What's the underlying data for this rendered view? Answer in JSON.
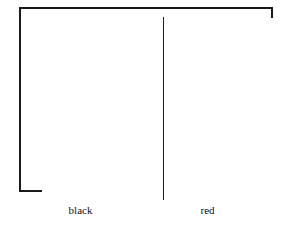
{
  "figure": {
    "background_color": "#ffffff",
    "line_color": "#1a1a1a",
    "panels": [
      {
        "id": "left",
        "caption": "black",
        "fill_color": "#ffffff"
      },
      {
        "id": "right",
        "caption": "red",
        "fill_color": "#ffffff"
      }
    ]
  }
}
